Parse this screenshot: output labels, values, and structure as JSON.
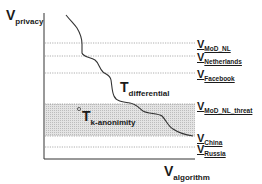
{
  "axes": {
    "y_label": {
      "main": "V",
      "sub": "privacy"
    },
    "x_label": {
      "main": "V",
      "sub": "algorithm"
    }
  },
  "curves": [
    {
      "label_main": "T",
      "label_sub": "differential"
    },
    {
      "label_main": "T",
      "label_sub": "k-anonimity",
      "marker": "°"
    }
  ],
  "levels": [
    {
      "main": "V",
      "sub": "MoD_NL",
      "y": 43
    },
    {
      "main": "V",
      "sub": "Netherlands",
      "y": 56
    },
    {
      "main": "V",
      "sub": "Facebook",
      "y": 73
    },
    {
      "main": "V",
      "sub": "MoD_NL_threat",
      "y": 104
    },
    {
      "main": "V",
      "sub": "China",
      "y": 136
    },
    {
      "main": "V",
      "sub": "Russia",
      "y": 147
    }
  ],
  "colors": {
    "axis": "#333333",
    "curve": "#333333",
    "dotted": "#9a9a9a",
    "band": "#d6d6d6"
  }
}
